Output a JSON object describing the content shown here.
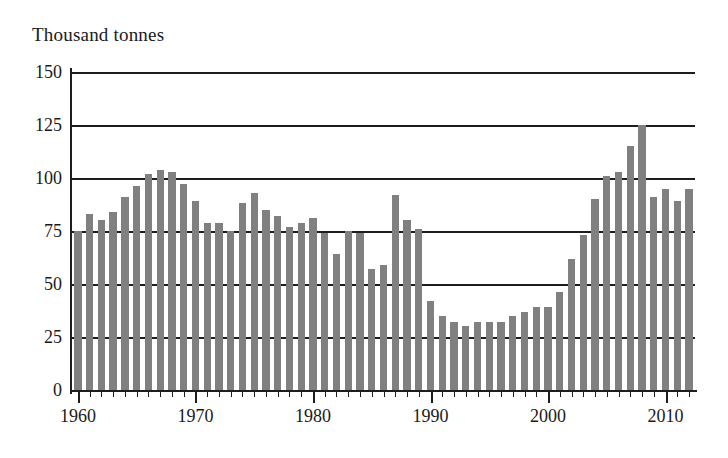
{
  "chart_data": {
    "type": "bar",
    "title": "Thousand tonnes",
    "ylabel": "Thousand tonnes",
    "xlabel": "",
    "ylim": [
      0,
      150
    ],
    "xlim": [
      1959.5,
      2012.5
    ],
    "yticks": [
      0,
      25,
      50,
      75,
      100,
      125,
      150
    ],
    "xticks_major": [
      1960,
      1970,
      1980,
      1990,
      2000,
      2010
    ],
    "xtick_labels": [
      "1960",
      "1970",
      "1980",
      "1990",
      "2000",
      "2010"
    ],
    "ytick_labels": [
      "0",
      "25",
      "50",
      "75",
      "100",
      "125",
      "150"
    ],
    "grid": "horizontal",
    "legend": "none",
    "bar_color": "#808080",
    "axis_color": "#1d1d1d",
    "categories": [
      1960,
      1961,
      1962,
      1963,
      1964,
      1965,
      1966,
      1967,
      1968,
      1969,
      1970,
      1971,
      1972,
      1973,
      1974,
      1975,
      1976,
      1977,
      1978,
      1979,
      1980,
      1981,
      1982,
      1983,
      1984,
      1985,
      1986,
      1987,
      1988,
      1989,
      1990,
      1991,
      1992,
      1993,
      1994,
      1995,
      1996,
      1997,
      1998,
      1999,
      2000,
      2001,
      2002,
      2003,
      2004,
      2005,
      2006,
      2007,
      2008,
      2009,
      2010,
      2011,
      2012
    ],
    "values": [
      75,
      83,
      80,
      84,
      91,
      96,
      102,
      104,
      103,
      97,
      89,
      79,
      79,
      75,
      88,
      93,
      85,
      82,
      77,
      79,
      81,
      74,
      64,
      75,
      74,
      57,
      59,
      92,
      80,
      76,
      42,
      35,
      32,
      30,
      32,
      32,
      32,
      35,
      37,
      39,
      39,
      46,
      62,
      73,
      90,
      101,
      103,
      115,
      125,
      91,
      95,
      89,
      95
    ]
  }
}
